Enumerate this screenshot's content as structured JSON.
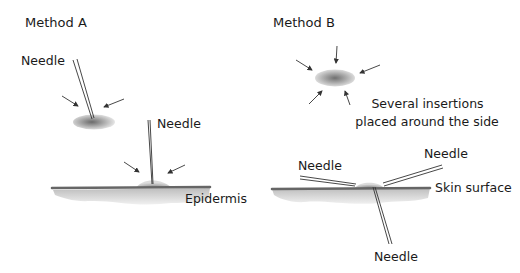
{
  "panels": {
    "method_a": {
      "title": "Method A",
      "labels": {
        "needle_top": "Needle",
        "needle_skin": "Needle",
        "epidermis": "Epidermis"
      }
    },
    "method_b": {
      "title": "Method B",
      "caption_line1": "Several insertions",
      "caption_line2": "placed around the side",
      "labels": {
        "needle_left": "Needle",
        "needle_right": "Needle",
        "needle_bottom": "Needle",
        "skin_surface": "Skin surface"
      }
    }
  },
  "colors": {
    "line": "#333333",
    "skin_bar": "#666666",
    "skin_shadow": "#c8c8c8",
    "blob_dark": "#777777",
    "blob_light": "#e0e0e0"
  }
}
